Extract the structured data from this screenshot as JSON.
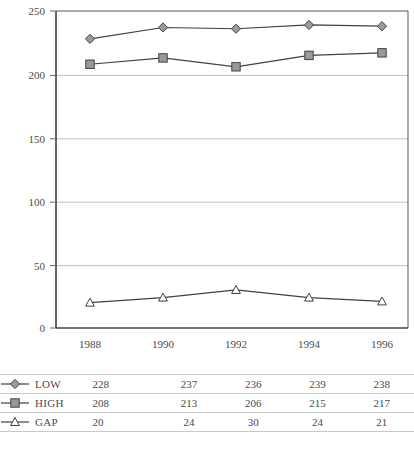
{
  "chart_data": {
    "type": "line",
    "title": "",
    "xlabel": "",
    "ylabel": "",
    "categories": [
      "1988",
      "1990",
      "1992",
      "1994",
      "1996"
    ],
    "ylim": [
      0,
      250
    ],
    "yticks": [
      0,
      50,
      100,
      150,
      200,
      250
    ],
    "grid": true,
    "legend_position": "table-below",
    "series": [
      {
        "name": "LOW",
        "marker": "diamond",
        "values": [
          228,
          237,
          236,
          239,
          238
        ]
      },
      {
        "name": "HIGH",
        "marker": "square",
        "values": [
          208,
          213,
          206,
          215,
          217
        ]
      },
      {
        "name": "GAP",
        "marker": "open-triangle",
        "values": [
          20,
          24,
          30,
          24,
          21
        ]
      }
    ]
  },
  "axis": {
    "yticks": [
      "0",
      "50",
      "100",
      "150",
      "200",
      "250"
    ],
    "xticks": [
      "1988",
      "1990",
      "1992",
      "1994",
      "1996"
    ]
  },
  "table": {
    "rows": [
      {
        "label": "LOW",
        "marker": "diamond",
        "values": [
          "228",
          "237",
          "236",
          "239",
          "238"
        ]
      },
      {
        "label": "HIGH",
        "marker": "square",
        "values": [
          "208",
          "213",
          "206",
          "215",
          "217"
        ]
      },
      {
        "label": "GAP",
        "marker": "open-triangle",
        "values": [
          "20",
          "24",
          "30",
          "24",
          "21"
        ]
      }
    ]
  },
  "colors": {
    "marker_fill": "#9a9a9a",
    "marker_stroke": "#404040",
    "line": "#404040",
    "grid": "#c0c0c0",
    "axis": "#404040",
    "text": "#4a4a4a",
    "open_marker_fill": "#ffffff"
  }
}
